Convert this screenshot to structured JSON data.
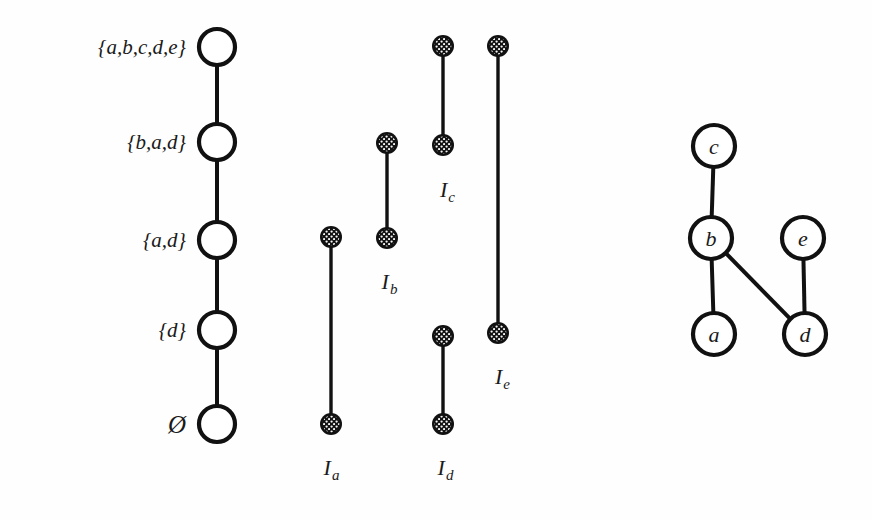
{
  "figure": {
    "background_color": "#fefefe",
    "ink_color": "#111111"
  },
  "chain": {
    "name": "nested-set-chain",
    "node_radius": 18,
    "center_x": 217,
    "nodes": [
      {
        "label": "{a,b,c,d,e}",
        "cy": 47,
        "label_x": 186,
        "label_style": "set"
      },
      {
        "label": "{b,a,d}",
        "cy": 142,
        "label_x": 186,
        "label_style": "set"
      },
      {
        "label": "{a,d}",
        "cy": 240,
        "label_x": 186,
        "label_style": "set"
      },
      {
        "label": "{d}",
        "cy": 330,
        "label_x": 186,
        "label_style": "set"
      },
      {
        "label": "Ø",
        "cy": 424,
        "label_x": 186,
        "label_style": "empty"
      }
    ]
  },
  "intervals": {
    "name": "interval-diagram",
    "dot_radius": 11,
    "items": [
      {
        "id": "Ia",
        "letter": "I",
        "subscript": "a",
        "x": 331,
        "top_y": 237,
        "bottom_y": 424,
        "label_x": 331,
        "label_y": 468
      },
      {
        "id": "Ib",
        "letter": "I",
        "subscript": "b",
        "x": 387,
        "top_y": 143,
        "bottom_y": 238,
        "label_x": 389,
        "label_y": 282
      },
      {
        "id": "Ic",
        "letter": "I",
        "subscript": "c",
        "x": 443,
        "top_y": 46,
        "bottom_y": 145,
        "label_x": 447,
        "label_y": 190
      },
      {
        "id": "Id",
        "letter": "I",
        "subscript": "d",
        "x": 443,
        "top_y": 336,
        "bottom_y": 424,
        "label_x": 445,
        "label_y": 468
      },
      {
        "id": "Ie",
        "letter": "I",
        "subscript": "e",
        "x": 498,
        "top_y": 46,
        "bottom_y": 333,
        "label_x": 502,
        "label_y": 377
      }
    ]
  },
  "graph": {
    "name": "interval-graph",
    "node_radius": 21,
    "nodes": [
      {
        "id": "c",
        "label": "c",
        "cx": 714,
        "cy": 146
      },
      {
        "id": "b",
        "label": "b",
        "cx": 711,
        "cy": 238
      },
      {
        "id": "e",
        "label": "e",
        "cx": 803,
        "cy": 238
      },
      {
        "id": "a",
        "label": "a",
        "cx": 714,
        "cy": 334
      },
      {
        "id": "d",
        "label": "d",
        "cx": 805,
        "cy": 334
      }
    ],
    "edges": [
      {
        "from": "c",
        "to": "b"
      },
      {
        "from": "b",
        "to": "a"
      },
      {
        "from": "b",
        "to": "d"
      },
      {
        "from": "e",
        "to": "d"
      }
    ]
  }
}
